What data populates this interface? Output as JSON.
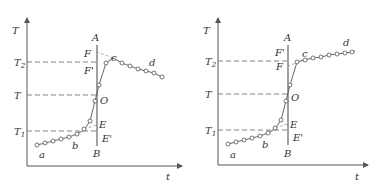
{
  "diagrams": [
    {
      "name": "left",
      "labels": {
        "y_axis": "T",
        "x_axis": "t",
        "T2": "T",
        "T2_sub": "2",
        "T": "T",
        "T1": "T",
        "T1_sub": "1",
        "A": "A",
        "B": "B",
        "F": "F",
        "F_prime": "F'",
        "O": "O",
        "E": "E",
        "E_prime": "E'",
        "a": "a",
        "b": "b",
        "c": "c",
        "d": "d"
      }
    },
    {
      "name": "right",
      "labels": {
        "y_axis": "T",
        "x_axis": "t",
        "T2": "T",
        "T2_sub": "2",
        "T": "T",
        "T1": "T",
        "T1_sub": "1",
        "A": "A",
        "B": "B",
        "F": "F",
        "F_prime": "F'",
        "O": "O",
        "E": "E",
        "E_prime": "E'",
        "a": "a",
        "b": "b",
        "c": "c",
        "d": "d"
      }
    }
  ]
}
